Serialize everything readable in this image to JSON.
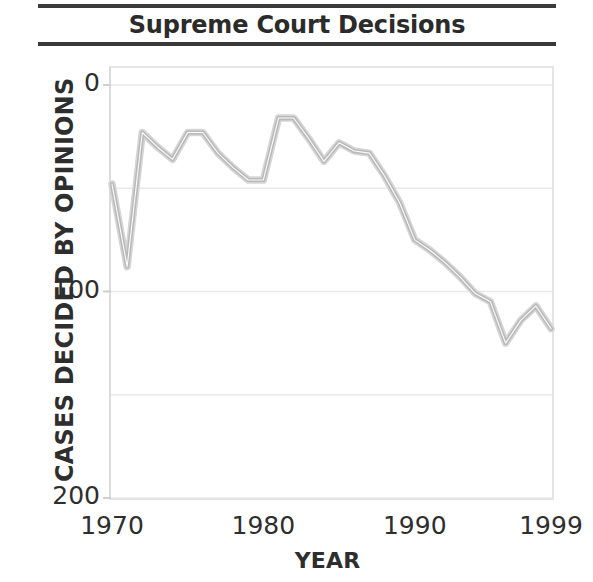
{
  "title": "Supreme Court Decisions",
  "axis": {
    "xlabel": "YEAR",
    "ylabel": "CASES DECIDED BY OPINIONS",
    "xticks": [
      "1970",
      "1980",
      "1990",
      "1999"
    ],
    "yticks": [
      "200",
      "100",
      "0"
    ]
  },
  "colors": {
    "line": "#b9b9b9",
    "grid": "#e8e8e8",
    "frame": "#e3e3e3",
    "text": "#2e2e2e",
    "rule": "#3a3a3a",
    "background": "#ffffff"
  },
  "chart_data": {
    "type": "line",
    "title": "Supreme Court Decisions",
    "xlabel": "YEAR",
    "ylabel": "CASES DECIDED BY OPINIONS",
    "xlim": [
      1970,
      1999
    ],
    "ylim": [
      0,
      210
    ],
    "xticks": [
      1970,
      1980,
      1990,
      1999
    ],
    "yticks": [
      0,
      100,
      200
    ],
    "grid": true,
    "gridlines_y": [
      0,
      50,
      100,
      150,
      200
    ],
    "legend": "none",
    "series": [
      {
        "name": "Cases decided by opinions",
        "color": "#b9b9b9",
        "x": [
          1970,
          1971,
          1972,
          1973,
          1974,
          1975,
          1976,
          1977,
          1978,
          1979,
          1980,
          1981,
          1982,
          1983,
          1984,
          1985,
          1986,
          1987,
          1988,
          1989,
          1990,
          1991,
          1992,
          1993,
          1994,
          1995,
          1996,
          1997,
          1998,
          1999
        ],
        "values": [
          152,
          112,
          177,
          170,
          164,
          177,
          177,
          167,
          160,
          154,
          154,
          184,
          184,
          174,
          163,
          172,
          168,
          167,
          156,
          143,
          125,
          120,
          114,
          107,
          99,
          95,
          75,
          86,
          93,
          82
        ]
      }
    ]
  }
}
